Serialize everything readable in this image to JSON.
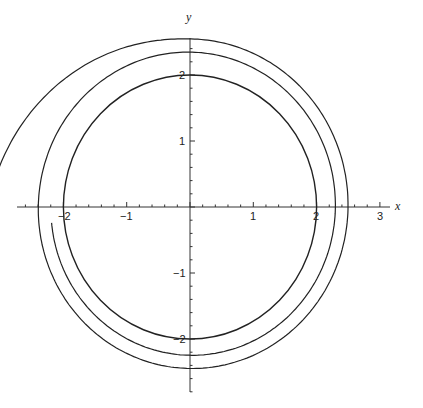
{
  "chart_data": {
    "type": "line",
    "title": "",
    "xlabel": "x",
    "ylabel": "y",
    "xlim": [
      -2.7,
      3.2
    ],
    "ylim": [
      -2.9,
      2.5
    ],
    "grid": false,
    "x_ticks": [
      -2,
      -1,
      1,
      2,
      3
    ],
    "y_ticks": [
      2,
      1,
      -1,
      -2
    ],
    "tick_labels": {
      "x": [
        "-2",
        "-1",
        "1",
        "2",
        "3"
      ],
      "y": [
        "2",
        "1",
        "-1",
        "-2"
      ]
    },
    "series": [
      {
        "name": "limit-circle",
        "shape": "circle",
        "center": [
          0,
          0
        ],
        "radius": 2.0
      },
      {
        "name": "spiral-trajectory",
        "shape": "spiral",
        "start_point": [
          -2.2,
          -0.25
        ],
        "end_point": [
          3.0,
          0.0
        ],
        "radii_samples": {
          "bottom": [
            2.18,
            2.39,
            2.59
          ],
          "right": [
            2.2,
            2.4,
            3.0
          ],
          "top": [
            2.17,
            2.38
          ],
          "left": [
            2.42,
            2.62
          ]
        }
      }
    ]
  },
  "labels": {
    "x_axis": "x",
    "y_axis": "y",
    "xt": [
      "−2",
      "−1",
      "1",
      "2",
      "3"
    ],
    "yt": [
      "2",
      "1",
      "−1",
      "−2"
    ]
  }
}
